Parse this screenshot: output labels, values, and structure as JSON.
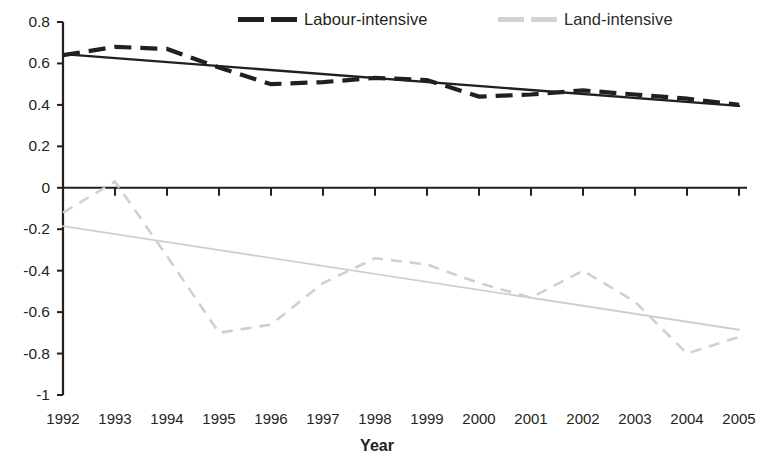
{
  "chart_data": {
    "type": "line",
    "title": "",
    "xlabel": "Year",
    "ylabel": "",
    "x": [
      1992,
      1993,
      1994,
      1995,
      1996,
      1997,
      1998,
      1999,
      2000,
      2001,
      2002,
      2003,
      2004,
      2005
    ],
    "categories": [
      "1992",
      "1993",
      "1994",
      "1995",
      "1996",
      "1997",
      "1998",
      "1999",
      "2000",
      "2001",
      "2002",
      "2003",
      "2004",
      "2005"
    ],
    "xlim": [
      1992,
      2005
    ],
    "ylim": [
      -1.0,
      0.8
    ],
    "yticks": [
      0.8,
      0.6,
      0.4,
      0.2,
      0,
      -0.2,
      -0.4,
      -0.6,
      -0.8,
      -1
    ],
    "ytick_labels": [
      "0.8",
      "0.6",
      "0.4",
      "0.2",
      "0",
      "-0.2",
      "-0.4",
      "-0.6",
      "-0.8",
      "-1"
    ],
    "grid": false,
    "legend_position": "top",
    "series": [
      {
        "name": "Labour-intensive",
        "style": "dashed",
        "color": "#231f20",
        "values": [
          0.64,
          0.68,
          0.67,
          0.58,
          0.5,
          0.51,
          0.53,
          0.52,
          0.44,
          0.45,
          0.47,
          0.45,
          0.43,
          0.4
        ]
      },
      {
        "name": "Land-intensive",
        "style": "dashed",
        "color": "#d0d0d0",
        "values": [
          -0.12,
          0.03,
          -0.33,
          -0.7,
          -0.66,
          -0.46,
          -0.34,
          -0.37,
          -0.46,
          -0.53,
          -0.4,
          -0.55,
          -0.8,
          -0.72
        ]
      }
    ],
    "trendlines": [
      {
        "name": "Labour-intensive trend",
        "color": "#231f20",
        "style": "solid",
        "start": {
          "x": 1992,
          "y": 0.645
        },
        "end": {
          "x": 2005,
          "y": 0.395
        }
      },
      {
        "name": "Land-intensive trend",
        "color": "#cfcfcf",
        "style": "solid",
        "start": {
          "x": 1992,
          "y": -0.185
        },
        "end": {
          "x": 2005,
          "y": -0.685
        }
      }
    ],
    "legend": [
      {
        "label": "Labour-intensive",
        "color": "#231f20"
      },
      {
        "label": "Land-intensive",
        "color": "#d3d3d3"
      }
    ]
  },
  "legend": {
    "labour_label": "Labour-intensive",
    "land_label": "Land-intensive"
  },
  "axes": {
    "x_title": "Year"
  }
}
